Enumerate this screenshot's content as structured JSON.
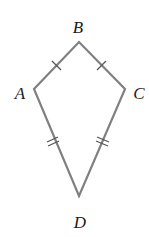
{
  "figure": {
    "type": "kite",
    "stroke_color": "#808080",
    "label_color": "#1a1a1a",
    "background": "#ffffff",
    "vertices": {
      "A": {
        "label": "A",
        "x": 34,
        "y": 89,
        "label_x": 21,
        "label_y": 99
      },
      "B": {
        "label": "B",
        "x": 79,
        "y": 42,
        "label_x": 78,
        "label_y": 33
      },
      "C": {
        "label": "C",
        "x": 125,
        "y": 89,
        "label_x": 139,
        "label_y": 99
      },
      "D": {
        "label": "D",
        "x": 79,
        "y": 196,
        "label_x": 80,
        "label_y": 228
      }
    },
    "sides": [
      {
        "from": "A",
        "to": "B",
        "tick_marks": 1
      },
      {
        "from": "B",
        "to": "C",
        "tick_marks": 1
      },
      {
        "from": "C",
        "to": "D",
        "tick_marks": 2
      },
      {
        "from": "D",
        "to": "A",
        "tick_marks": 2
      }
    ]
  }
}
